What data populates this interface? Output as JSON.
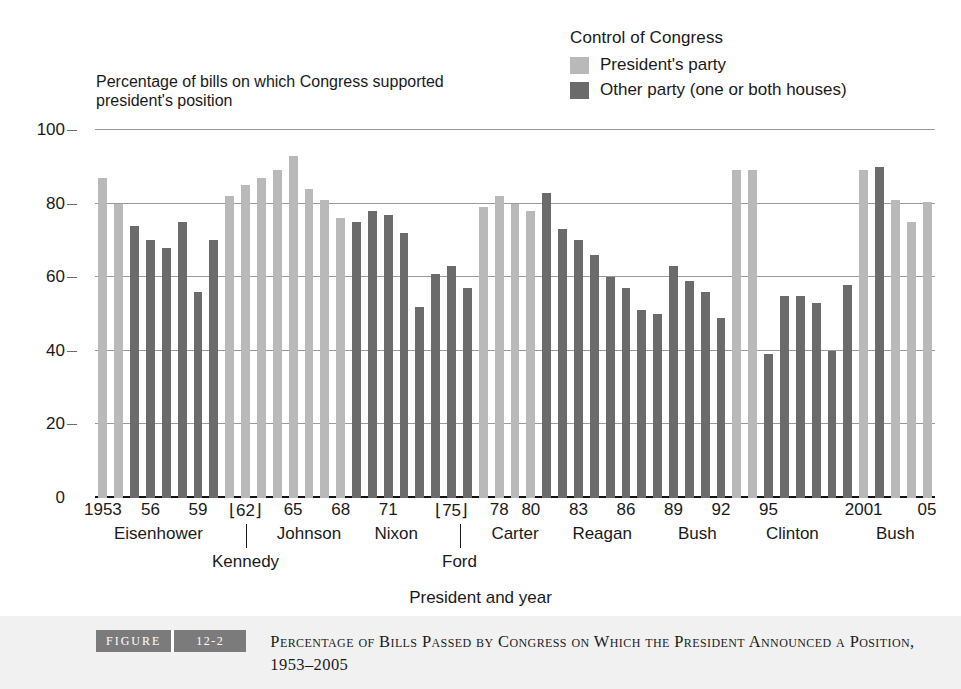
{
  "legend": {
    "title": "Control of Congress",
    "items": [
      {
        "label": "President's party",
        "color": "#b9b9b9",
        "key": "own"
      },
      {
        "label": "Other party (one or both houses)",
        "color": "#6b6b6b",
        "key": "other"
      }
    ]
  },
  "y_caption": "Percentage of bills on which Congress supported president's position",
  "x_axis_title": "President and year",
  "caption": {
    "figure_word": "FIGURE",
    "figure_number": "12-2",
    "title": "Percentage of Bills Passed by Congress on Which the President Announced a Position, 1953–2005"
  },
  "chart_data": {
    "type": "bar",
    "title": "Percentage of Bills Passed by Congress on Which the President Announced a Position, 1953–2005",
    "xlabel": "President and year",
    "ylabel": "Percentage of bills on which Congress supported president's position",
    "ylim": [
      0,
      100
    ],
    "yticks": [
      0,
      20,
      40,
      60,
      80,
      100
    ],
    "grid": true,
    "legend_position": "top-right",
    "series_key": "control",
    "categories": [
      "1953",
      "1954",
      "1955",
      "1956",
      "1957",
      "1958",
      "1959",
      "1960",
      "1961",
      "1962",
      "1963",
      "1964",
      "1965",
      "1966",
      "1967",
      "1968",
      "1969",
      "1970",
      "1971",
      "1972",
      "1973",
      "1974",
      "1975",
      "1976",
      "1977",
      "1978",
      "1979",
      "1980",
      "1981",
      "1982",
      "1983",
      "1984",
      "1985",
      "1986",
      "1987",
      "1988",
      "1989",
      "1990",
      "1991",
      "1992",
      "1993",
      "1994",
      "1995",
      "1996",
      "1997",
      "1998",
      "1999",
      "2000",
      "2001",
      "2002",
      "2003",
      "2004",
      "2005"
    ],
    "values": [
      87,
      80,
      74,
      70,
      68,
      75,
      56,
      70,
      82,
      85,
      87,
      89,
      93,
      84,
      81,
      76,
      75,
      78,
      77,
      72,
      52,
      61,
      63,
      57,
      79,
      82,
      80,
      78,
      83,
      73,
      70,
      66,
      60,
      57,
      51,
      50,
      63,
      59,
      56,
      49,
      89,
      89,
      39,
      55,
      55,
      53,
      40,
      58,
      89,
      90,
      81,
      75,
      80.5
    ],
    "control": [
      "own",
      "own",
      "other",
      "other",
      "other",
      "other",
      "other",
      "other",
      "own",
      "own",
      "own",
      "own",
      "own",
      "own",
      "own",
      "own",
      "other",
      "other",
      "other",
      "other",
      "other",
      "other",
      "other",
      "other",
      "own",
      "own",
      "own",
      "own",
      "other",
      "other",
      "other",
      "other",
      "other",
      "other",
      "other",
      "other",
      "other",
      "other",
      "other",
      "other",
      "own",
      "own",
      "other",
      "other",
      "other",
      "other",
      "other",
      "other",
      "own",
      "other",
      "own",
      "own",
      "own"
    ],
    "year_ticks": [
      {
        "label": "1953",
        "index": 0,
        "bracket": false
      },
      {
        "label": "56",
        "index": 3,
        "bracket": false
      },
      {
        "label": "59",
        "index": 6,
        "bracket": false
      },
      {
        "label": "62",
        "index": 9,
        "bracket": true
      },
      {
        "label": "65",
        "index": 12,
        "bracket": false
      },
      {
        "label": "68",
        "index": 15,
        "bracket": false
      },
      {
        "label": "71",
        "index": 18,
        "bracket": false
      },
      {
        "label": "75",
        "index": 22,
        "bracket": true
      },
      {
        "label": "78",
        "index": 25,
        "bracket": false
      },
      {
        "label": "80",
        "index": 27,
        "bracket": false
      },
      {
        "label": "83",
        "index": 30,
        "bracket": false
      },
      {
        "label": "86",
        "index": 33,
        "bracket": false
      },
      {
        "label": "89",
        "index": 36,
        "bracket": false
      },
      {
        "label": "92",
        "index": 39,
        "bracket": false
      },
      {
        "label": "95",
        "index": 42,
        "bracket": false
      },
      {
        "label": "2001",
        "index": 48,
        "bracket": false
      },
      {
        "label": "05",
        "index": 52,
        "bracket": false
      }
    ],
    "president_labels": [
      {
        "name": "Eisenhower",
        "center_index": 3.5,
        "row": "upper"
      },
      {
        "name": "Kennedy",
        "center_index": 9.0,
        "row": "lower"
      },
      {
        "name": "Johnson",
        "center_index": 13.0,
        "row": "upper"
      },
      {
        "name": "Nixon",
        "center_index": 18.5,
        "row": "upper"
      },
      {
        "name": "Ford",
        "center_index": 22.5,
        "row": "lower"
      },
      {
        "name": "Carter",
        "center_index": 26.0,
        "row": "upper"
      },
      {
        "name": "Reagan",
        "center_index": 31.5,
        "row": "upper"
      },
      {
        "name": "Bush",
        "center_index": 37.5,
        "row": "upper"
      },
      {
        "name": "Clinton",
        "center_index": 43.5,
        "row": "upper"
      },
      {
        "name": "Bush",
        "center_index": 50.0,
        "row": "upper"
      }
    ]
  }
}
